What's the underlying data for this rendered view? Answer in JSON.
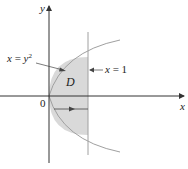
{
  "diagram": {
    "axes": {
      "x_label": "x",
      "y_label": "y",
      "origin_label": "0"
    },
    "curves": [
      {
        "name": "parabola",
        "equation_label": "x = y²",
        "lhs": "x",
        "rhs": "y",
        "exponent": "2"
      },
      {
        "name": "vertical-line",
        "equation_label": "x = 1",
        "lhs": "x",
        "rhs": "1"
      }
    ],
    "region": {
      "label": "D",
      "fill_color": "#d9d9d9"
    },
    "colors": {
      "axis": "#333333",
      "curve": "#9a9a9a",
      "region": "#d9d9d9",
      "arrow": "#444444"
    }
  }
}
